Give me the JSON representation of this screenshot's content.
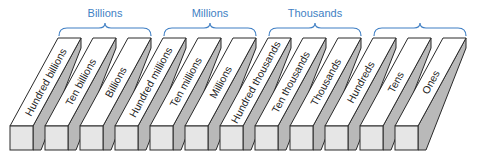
{
  "groups": [
    {
      "label": "Billions",
      "start_index": 0,
      "end_index": 2
    },
    {
      "label": "Millions",
      "start_index": 3,
      "end_index": 5
    },
    {
      "label": "Thousands",
      "start_index": 6,
      "end_index": 8
    },
    {
      "label": "",
      "start_index": 9,
      "end_index": 11
    }
  ],
  "places": [
    {
      "label": "Hundred billions"
    },
    {
      "label": "Ten billions"
    },
    {
      "label": "Billions"
    },
    {
      "label": "Hundred millions"
    },
    {
      "label": "Ten millions"
    },
    {
      "label": "Millions"
    },
    {
      "label": "Hundred thousands"
    },
    {
      "label": "Ten thousands"
    },
    {
      "label": "Thousands"
    },
    {
      "label": "Hundreds"
    },
    {
      "label": "Tens"
    },
    {
      "label": "Ones"
    }
  ],
  "colors": {
    "brace": "#3f7fc4",
    "label_text": "#3f7fc4",
    "bar_top": "#ffffff",
    "bar_side": "#b9b9b9",
    "bar_front": "#e6e6e6",
    "outline": "#2a2a2a",
    "bar_text": "#222222"
  }
}
